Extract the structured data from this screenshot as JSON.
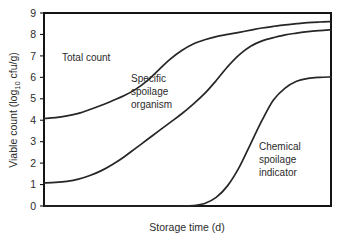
{
  "chart_data": {
    "type": "line",
    "title": "",
    "xlabel": "Storage time (d)",
    "ylabel": "Viable count (log10 cfu/g)",
    "ylabel_parts": {
      "before": "Viable count (log",
      "subscript": "10",
      "after": " cfu/g)"
    },
    "ylim": [
      0,
      9
    ],
    "xlim": [
      0,
      100
    ],
    "yticks": [
      0,
      1,
      2,
      3,
      4,
      5,
      6,
      7,
      8,
      9
    ],
    "ytick_labels": [
      "0",
      "1",
      "2",
      "3",
      "4",
      "5",
      "6",
      "7",
      "8",
      "9"
    ],
    "xticks": [],
    "xtick_labels": [],
    "grid": false,
    "legend": "inline-annotations",
    "line_color": "#262626",
    "axis_color": "#151515",
    "background": "#ffffff",
    "series": [
      {
        "name": "Total count",
        "label": "Total count",
        "x": [
          0,
          4,
          8,
          12,
          16,
          20,
          24,
          28,
          32,
          36,
          40,
          44,
          48,
          52,
          56,
          60,
          64,
          68,
          72,
          76,
          80,
          84,
          88,
          92,
          96,
          100
        ],
        "values": [
          4.08,
          4.12,
          4.2,
          4.32,
          4.5,
          4.7,
          4.92,
          5.15,
          5.45,
          5.85,
          6.35,
          6.85,
          7.25,
          7.55,
          7.75,
          7.9,
          8.0,
          8.1,
          8.2,
          8.3,
          8.38,
          8.45,
          8.5,
          8.55,
          8.58,
          8.6
        ]
      },
      {
        "name": "Specific spoilage organism",
        "label": "Specific spoilage organism",
        "label_lines": [
          "Specific",
          "spoilage",
          "organism"
        ],
        "x": [
          0,
          4,
          8,
          12,
          16,
          20,
          24,
          28,
          32,
          36,
          40,
          44,
          48,
          52,
          56,
          60,
          64,
          68,
          72,
          76,
          80,
          84,
          88,
          92,
          96,
          100
        ],
        "values": [
          1.08,
          1.1,
          1.15,
          1.25,
          1.42,
          1.65,
          1.95,
          2.3,
          2.7,
          3.1,
          3.5,
          3.9,
          4.3,
          4.75,
          5.25,
          5.85,
          6.5,
          7.05,
          7.45,
          7.7,
          7.85,
          7.98,
          8.06,
          8.13,
          8.18,
          8.22
        ]
      },
      {
        "name": "Chemical spoilage indicator",
        "label": "Chemical spoilage indicator",
        "label_lines": [
          "Chemical",
          "spoilage",
          "indicator"
        ],
        "x": [
          0,
          8,
          16,
          24,
          32,
          40,
          48,
          52,
          56,
          60,
          64,
          68,
          72,
          76,
          80,
          84,
          88,
          92,
          96,
          100
        ],
        "values": [
          0.0,
          0.0,
          0.0,
          0.0,
          0.0,
          0.0,
          0.0,
          0.02,
          0.12,
          0.4,
          0.95,
          1.8,
          2.9,
          4.0,
          4.95,
          5.5,
          5.82,
          5.95,
          6.0,
          6.02
        ]
      }
    ],
    "annotations": [
      {
        "text": "Total count",
        "x_frac": 0.12,
        "y_value": 7.0
      },
      {
        "text": "Specific spoilage organism",
        "x_frac": 0.38,
        "y_value": 5.6
      },
      {
        "text": "Chemical spoilage indicator",
        "x_frac": 0.74,
        "y_value": 3.4
      }
    ]
  }
}
